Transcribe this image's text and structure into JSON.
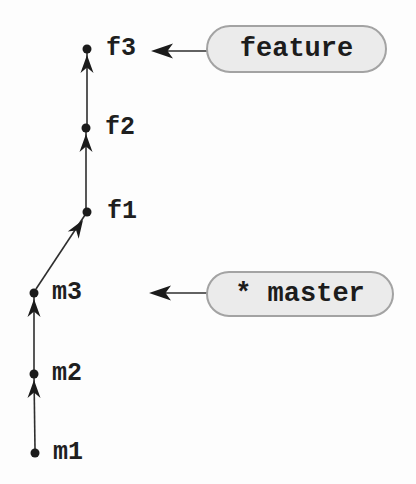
{
  "diagram": {
    "type": "git-commit-graph",
    "commits": [
      {
        "id": "m1",
        "label": "m1"
      },
      {
        "id": "m2",
        "label": "m2"
      },
      {
        "id": "m3",
        "label": "m3"
      },
      {
        "id": "f1",
        "label": "f1"
      },
      {
        "id": "f2",
        "label": "f2"
      },
      {
        "id": "f3",
        "label": "f3"
      }
    ],
    "edges": [
      {
        "from": "m1",
        "to": "m2"
      },
      {
        "from": "m2",
        "to": "m3"
      },
      {
        "from": "m3",
        "to": "f1"
      },
      {
        "from": "f1",
        "to": "f2"
      },
      {
        "from": "f2",
        "to": "f3"
      }
    ],
    "branch_labels": [
      {
        "label": "feature",
        "points_to": "f3",
        "current": false
      },
      {
        "label": "* master",
        "points_to": "m3",
        "current": true
      }
    ],
    "colors": {
      "node": "#1b1b1b",
      "edge": "#2e2e2e",
      "arrowhead": "#1b1b1b",
      "pill_fill": "#ebebeb",
      "pill_border": "#a3a3a3",
      "text": "#1f1f1f",
      "background": "#fdfdfd"
    }
  }
}
